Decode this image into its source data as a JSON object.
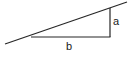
{
  "figure": {
    "type": "right-triangle-diagram",
    "title": "",
    "background_color": "#ffffff",
    "stroke_color": "#262626",
    "stroke_width": 1.2,
    "text_color": "#1a1a1a",
    "labels": {
      "vertical_leg": "a",
      "horizontal_leg": "b"
    },
    "geometry": {
      "right_angle_vertex": {
        "x": 110,
        "y": 37
      },
      "base_left_vertex": {
        "x": 31,
        "y": 37
      },
      "apex_vertex": {
        "x": 110,
        "y": 8
      },
      "hypotenuse_start": {
        "x": 5,
        "y": 44
      },
      "hypotenuse_end": {
        "x": 127,
        "y": 2
      },
      "vertical_leg_top": {
        "x": 110,
        "y": 8
      },
      "vertical_leg_bottom": {
        "x": 110,
        "y": 37
      },
      "horizontal_leg_left": {
        "x": 31,
        "y": 37
      },
      "horizontal_leg_right": {
        "x": 110,
        "y": 37
      }
    },
    "label_positions": {
      "a": {
        "x": 116,
        "y": 22
      },
      "b": {
        "x": 70,
        "y": 47
      }
    }
  }
}
